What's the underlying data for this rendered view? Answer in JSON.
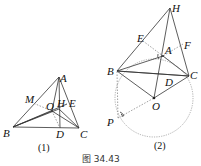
{
  "figure_caption": "图 34.43",
  "figure1": {
    "label": "(1)",
    "points": {
      "A": "A",
      "B": "B",
      "C": "C",
      "D": "D",
      "E": "E",
      "H": "H",
      "M": "M",
      "O": "O"
    }
  },
  "figure2": {
    "label": "(2)",
    "points": {
      "H": "H",
      "E": "E",
      "A": "A",
      "F": "F",
      "B": "B",
      "C": "C",
      "D": "D",
      "O": "O",
      "P": "P"
    }
  }
}
